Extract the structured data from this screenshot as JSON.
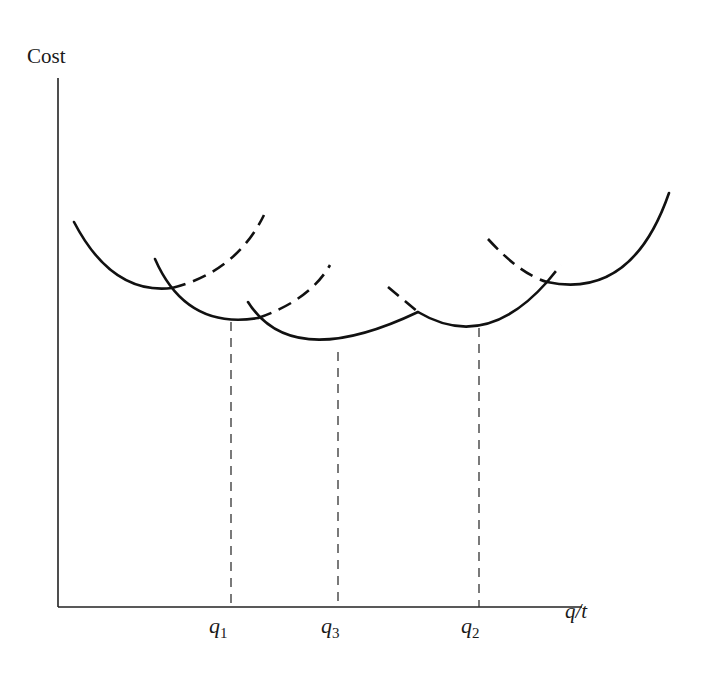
{
  "diagram": {
    "type": "cost-curves",
    "y_axis": {
      "label": "Cost"
    },
    "x_axis": {
      "label": "q/t"
    },
    "markers": [
      {
        "id": "q1",
        "base": "q",
        "sub": "1",
        "x": 231
      },
      {
        "id": "q3",
        "base": "q",
        "sub": "3",
        "x": 338
      },
      {
        "id": "q2",
        "base": "q",
        "sub": "2",
        "x": 479
      }
    ],
    "curves": [
      {
        "name": "curve-1",
        "solid": "M74,222 Q112,295 172,288",
        "dashed": "M172,288 Q235,272 264,215"
      },
      {
        "name": "curve-2",
        "solid": "M155,259 Q186,330 258,318",
        "dashed": "M258,318 Q310,300 330,265"
      },
      {
        "name": "curve-3",
        "solid": "M248,302 Q292,370 418,312",
        "dashed": ""
      },
      {
        "name": "curve-4",
        "solid": "M418,312 Q487,355 547,282",
        "dashed": "M388,287 L418,312 M547,282 L560,266"
      },
      {
        "name": "curve-5",
        "solid": "M547,282 Q630,300 669,193",
        "dashed": "M488,239 Q520,275 547,282"
      }
    ],
    "colors": {
      "line": "#111111",
      "guide": "#333333"
    }
  }
}
